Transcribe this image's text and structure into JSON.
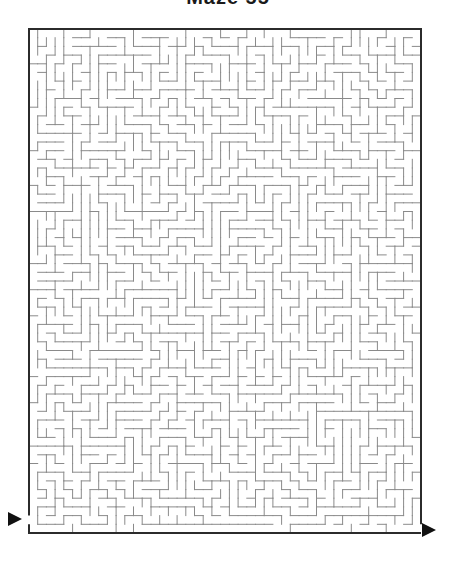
{
  "title": "Maze 55",
  "maze": {
    "cols": 45,
    "rows": 58,
    "origin": {
      "x": 29,
      "y": 29
    },
    "width": 392,
    "height": 504,
    "seed": 55,
    "entrance": {
      "side": "left",
      "row": 56
    },
    "exit": {
      "side": "right",
      "row": 57
    }
  },
  "arrows": {
    "entrance": {
      "points": "8,512 22,519 8,526"
    },
    "exit": {
      "points": "422,523 436,530 422,537"
    }
  },
  "colors": {
    "border": "#2b2b2b",
    "wall": "#8a8a8a",
    "arrow": "#111111",
    "background": "#ffffff"
  }
}
